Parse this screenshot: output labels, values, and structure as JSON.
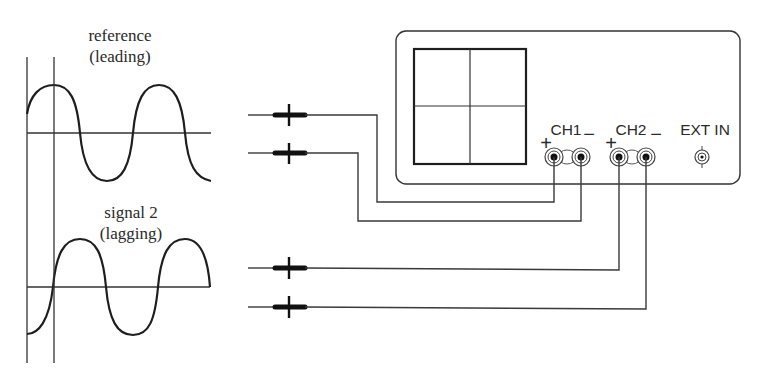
{
  "waveforms": {
    "reference": {
      "label_line1": "reference",
      "label_line2": "(leading)"
    },
    "signal2": {
      "label_line1": "signal 2",
      "label_line2": "(lagging)"
    }
  },
  "oscilloscope": {
    "channels": [
      {
        "name": "CH1",
        "plus": "+",
        "minus": "−"
      },
      {
        "name": "CH2",
        "plus": "+",
        "minus": "−"
      }
    ],
    "external_input": "EXT IN"
  },
  "probes": [
    {
      "id": "probe-1",
      "connects_to": "CH1 +"
    },
    {
      "id": "probe-2",
      "connects_to": "CH1 −"
    },
    {
      "id": "probe-3",
      "connects_to": "CH2 +"
    },
    {
      "id": "probe-4",
      "connects_to": "CH2 −"
    }
  ],
  "colors": {
    "line": "#333333",
    "background": "#ffffff"
  }
}
